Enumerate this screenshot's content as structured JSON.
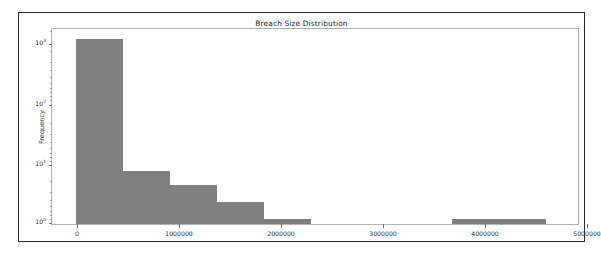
{
  "figure": {
    "title": "Breach Size Distribution",
    "background_color": "#ffffff",
    "border_color": "#2b2b2b",
    "bar_color": "#808080"
  },
  "axis": {
    "ylabel": "Frequency",
    "xlabel": "",
    "yscale": "log",
    "ytick_labels": [
      "10",
      "10",
      "10",
      "10"
    ],
    "ytick_exponents": [
      "3",
      "2",
      "1",
      "0"
    ],
    "xtick_labels": [
      "0",
      "1000000",
      "2000000",
      "3000000",
      "4000000",
      "5000000"
    ]
  },
  "chart_data": {
    "type": "bar",
    "title": "Breach Size Distribution",
    "xlabel": "",
    "ylabel": "Frequency",
    "yscale": "log",
    "xlim": [
      -250000,
      5180000
    ],
    "ylim": [
      0.82,
      2100
    ],
    "grid": false,
    "legend": null,
    "xtick_values": [
      0,
      1000000,
      2000000,
      3000000,
      4000000,
      5000000
    ],
    "xtick_labels": [
      "0",
      "1000000",
      "2000000",
      "3000000",
      "4000000",
      "5000000"
    ],
    "ytick_values": [
      1,
      10,
      100,
      1000
    ],
    "ytick_labels": [
      "10^0",
      "10^1",
      "10^2",
      "10^3"
    ],
    "bin_edges": [
      0,
      485000,
      970000,
      1455000,
      1940000,
      2425000,
      2910000,
      3395000,
      3880000,
      4365000,
      4850000
    ],
    "bin_centers": [
      242500,
      727500,
      1212500,
      1697500,
      2182500,
      2667500,
      3152500,
      3637500,
      4122500,
      4607500
    ],
    "values": [
      1400,
      7,
      4,
      2,
      1,
      0,
      0,
      0,
      1,
      1
    ],
    "bars": [
      {
        "x0": 0,
        "x1": 485000,
        "height": 1400
      },
      {
        "x0": 485000,
        "x1": 970000,
        "height": 7
      },
      {
        "x0": 970000,
        "x1": 1455000,
        "height": 4
      },
      {
        "x0": 1455000,
        "x1": 1940000,
        "height": 2
      },
      {
        "x0": 1940000,
        "x1": 2425000,
        "height": 1
      },
      {
        "x0": 2425000,
        "x1": 2910000,
        "height": 0
      },
      {
        "x0": 2910000,
        "x1": 3395000,
        "height": 0
      },
      {
        "x0": 3395000,
        "x1": 3880000,
        "height": 0
      },
      {
        "x0": 3880000,
        "x1": 4365000,
        "height": 1
      },
      {
        "x0": 4365000,
        "x1": 4850000,
        "height": 1
      }
    ]
  }
}
